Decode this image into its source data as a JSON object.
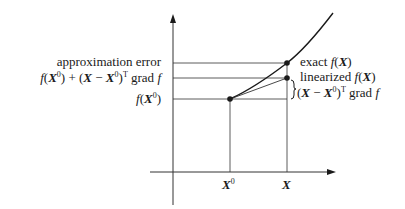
{
  "diagram": {
    "left_labels": {
      "approximation_error": "approximation error",
      "linearized_value": "f(X0) + (X − X0)T grad f",
      "base_value": "f(X0)"
    },
    "right_labels": {
      "exact": "exact f(X)",
      "linearized": "linearized f(X)",
      "increment": "(X − X0)T grad f"
    },
    "axis_labels": {
      "x0": "X0",
      "x": "X"
    },
    "text_parts": {
      "approx_error": "approximation error",
      "f": "f",
      "X": "X",
      "sup0": "0",
      "supT": "T",
      "plus": " + ",
      "minus": " − ",
      "grad": " grad ",
      "exact": "exact ",
      "linearized": "linearized "
    },
    "colors": {
      "line": "#1a1a1a",
      "guide": "#333333"
    }
  }
}
